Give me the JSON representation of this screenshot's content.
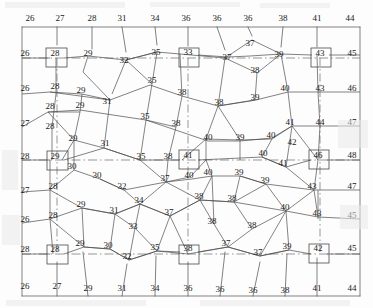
{
  "figure": {
    "kind": "survey-triangulation-network",
    "width": 373,
    "height": 308,
    "stroke_color": "#4a4a4a",
    "text_color": "#1a1a1a",
    "background": "#fdfdfd",
    "marker_shape": "square",
    "marker_count": 9,
    "baseline_style": "dash-dot"
  },
  "chart_data": {
    "type": "scatter",
    "title": "",
    "xlabel": "",
    "ylabel": "",
    "xlim": [
      0,
      373
    ],
    "ylim": [
      0,
      308
    ],
    "grid": false,
    "legend": null,
    "value_range": [
      26,
      48
    ],
    "nodes": [
      {
        "id": "n1",
        "label": "26",
        "x": 30,
        "y": 18,
        "boxed": false,
        "group": "border-top"
      },
      {
        "id": "n2",
        "label": "27",
        "x": 60,
        "y": 18,
        "boxed": false,
        "group": "border-top"
      },
      {
        "id": "n3",
        "label": "28",
        "x": 92,
        "y": 18,
        "boxed": false,
        "group": "border-top"
      },
      {
        "id": "n4",
        "label": "31",
        "x": 122,
        "y": 18,
        "boxed": false,
        "group": "border-top"
      },
      {
        "id": "n5",
        "label": "34",
        "x": 155,
        "y": 18,
        "boxed": false,
        "group": "border-top"
      },
      {
        "id": "n6",
        "label": "36",
        "x": 186,
        "y": 18,
        "boxed": false,
        "group": "border-top"
      },
      {
        "id": "n7",
        "label": "36",
        "x": 217,
        "y": 18,
        "boxed": false,
        "group": "border-top"
      },
      {
        "id": "n8",
        "label": "36",
        "x": 248,
        "y": 18,
        "boxed": false,
        "group": "border-top"
      },
      {
        "id": "n9",
        "label": "38",
        "x": 283,
        "y": 18,
        "boxed": false,
        "group": "border-top"
      },
      {
        "id": "n10",
        "label": "41",
        "x": 317,
        "y": 18,
        "boxed": false,
        "group": "border-top"
      },
      {
        "id": "n11",
        "label": "44",
        "x": 350,
        "y": 18,
        "boxed": false,
        "group": "border-top"
      },
      {
        "id": "m1",
        "label": "26",
        "x": 25,
        "y": 53,
        "boxed": false,
        "group": "row-b"
      },
      {
        "id": "m2",
        "label": "28",
        "x": 55,
        "y": 53,
        "boxed": true,
        "group": "row-b"
      },
      {
        "id": "m3",
        "label": "29",
        "x": 88,
        "y": 53,
        "boxed": false,
        "group": "row-b"
      },
      {
        "id": "m4",
        "label": "32",
        "x": 124,
        "y": 60,
        "boxed": false,
        "group": "row-b"
      },
      {
        "id": "m5",
        "label": "35",
        "x": 156,
        "y": 52,
        "boxed": false,
        "group": "row-b"
      },
      {
        "id": "m6",
        "label": "33",
        "x": 188,
        "y": 52,
        "boxed": true,
        "group": "row-b"
      },
      {
        "id": "m7",
        "label": "37",
        "x": 227,
        "y": 57,
        "boxed": false,
        "group": "row-b"
      },
      {
        "id": "m8",
        "label": "37",
        "x": 250,
        "y": 43,
        "boxed": false,
        "group": "row-b"
      },
      {
        "id": "m9",
        "label": "39",
        "x": 279,
        "y": 54,
        "boxed": false,
        "group": "row-b"
      },
      {
        "id": "m10",
        "label": "38",
        "x": 255,
        "y": 70,
        "boxed": false,
        "group": "row-b"
      },
      {
        "id": "m11",
        "label": "43",
        "x": 320,
        "y": 53,
        "boxed": true,
        "group": "row-b"
      },
      {
        "id": "m12",
        "label": "45",
        "x": 352,
        "y": 53,
        "boxed": false,
        "group": "row-b"
      },
      {
        "id": "p1",
        "label": "26",
        "x": 25,
        "y": 88,
        "boxed": false,
        "group": "row-c"
      },
      {
        "id": "p2",
        "label": "28",
        "x": 55,
        "y": 86,
        "boxed": false,
        "group": "row-c"
      },
      {
        "id": "p3",
        "label": "29",
        "x": 81,
        "y": 90,
        "boxed": false,
        "group": "row-c"
      },
      {
        "id": "p4",
        "label": "31",
        "x": 107,
        "y": 101,
        "boxed": false,
        "group": "row-c"
      },
      {
        "id": "p5",
        "label": "35",
        "x": 152,
        "y": 80,
        "boxed": false,
        "group": "row-c"
      },
      {
        "id": "p6",
        "label": "38",
        "x": 182,
        "y": 92,
        "boxed": false,
        "group": "row-c"
      },
      {
        "id": "p7",
        "label": "38",
        "x": 219,
        "y": 102,
        "boxed": false,
        "group": "row-c"
      },
      {
        "id": "p8",
        "label": "39",
        "x": 255,
        "y": 97,
        "boxed": false,
        "group": "row-c"
      },
      {
        "id": "p9",
        "label": "40",
        "x": 285,
        "y": 88,
        "boxed": false,
        "group": "row-c"
      },
      {
        "id": "p10",
        "label": "43",
        "x": 320,
        "y": 88,
        "boxed": false,
        "group": "row-c"
      },
      {
        "id": "p11",
        "label": "46",
        "x": 352,
        "y": 88,
        "boxed": false,
        "group": "row-c"
      },
      {
        "id": "q1",
        "label": "27",
        "x": 25,
        "y": 123,
        "boxed": false,
        "group": "row-d"
      },
      {
        "id": "q2",
        "label": "28",
        "x": 50,
        "y": 106,
        "boxed": false,
        "group": "row-d"
      },
      {
        "id": "q3",
        "label": "29",
        "x": 80,
        "y": 105,
        "boxed": false,
        "group": "row-d"
      },
      {
        "id": "q4",
        "label": "35",
        "x": 145,
        "y": 116,
        "boxed": false,
        "group": "row-d"
      },
      {
        "id": "q5",
        "label": "38",
        "x": 176,
        "y": 123,
        "boxed": false,
        "group": "row-d"
      },
      {
        "id": "q6",
        "label": "40",
        "x": 208,
        "y": 137,
        "boxed": false,
        "group": "row-d"
      },
      {
        "id": "q7",
        "label": "39",
        "x": 240,
        "y": 137,
        "boxed": false,
        "group": "row-d"
      },
      {
        "id": "q8",
        "label": "40",
        "x": 271,
        "y": 135,
        "boxed": false,
        "group": "row-d"
      },
      {
        "id": "q9",
        "label": "41",
        "x": 290,
        "y": 122,
        "boxed": false,
        "group": "row-d"
      },
      {
        "id": "q10",
        "label": "44",
        "x": 320,
        "y": 122,
        "boxed": false,
        "group": "row-d"
      },
      {
        "id": "q11",
        "label": "47",
        "x": 352,
        "y": 122,
        "boxed": false,
        "group": "row-d"
      },
      {
        "id": "q12",
        "label": "42",
        "x": 292,
        "y": 142,
        "boxed": false,
        "group": "row-d"
      },
      {
        "id": "r1",
        "label": "28",
        "x": 25,
        "y": 156,
        "boxed": false,
        "group": "row-e"
      },
      {
        "id": "r2",
        "label": "28",
        "x": 50,
        "y": 126,
        "boxed": false,
        "group": "row-e"
      },
      {
        "id": "r3",
        "label": "29",
        "x": 73,
        "y": 138,
        "boxed": false,
        "group": "row-e"
      },
      {
        "id": "r4",
        "label": "31",
        "x": 105,
        "y": 143,
        "boxed": false,
        "group": "row-e"
      },
      {
        "id": "r5",
        "label": "29",
        "x": 55,
        "y": 156,
        "boxed": true,
        "group": "row-e"
      },
      {
        "id": "r6",
        "label": "35",
        "x": 141,
        "y": 156,
        "boxed": false,
        "group": "row-e"
      },
      {
        "id": "r7",
        "label": "38",
        "x": 168,
        "y": 156,
        "boxed": false,
        "group": "row-e"
      },
      {
        "id": "r8",
        "label": "41",
        "x": 188,
        "y": 155,
        "boxed": true,
        "group": "row-e"
      },
      {
        "id": "r9",
        "label": "40",
        "x": 263,
        "y": 153,
        "boxed": false,
        "group": "row-e"
      },
      {
        "id": "r10",
        "label": "41",
        "x": 283,
        "y": 163,
        "boxed": false,
        "group": "row-e"
      },
      {
        "id": "r11",
        "label": "46",
        "x": 318,
        "y": 155,
        "boxed": true,
        "group": "row-e"
      },
      {
        "id": "r12",
        "label": "48",
        "x": 352,
        "y": 155,
        "boxed": false,
        "group": "row-e"
      },
      {
        "id": "s1",
        "label": "30",
        "x": 72,
        "y": 166,
        "boxed": false,
        "group": "row-f"
      },
      {
        "id": "s2",
        "label": "30",
        "x": 97,
        "y": 175,
        "boxed": false,
        "group": "row-f"
      },
      {
        "id": "s3",
        "label": "37",
        "x": 165,
        "y": 178,
        "boxed": false,
        "group": "row-f"
      },
      {
        "id": "s4",
        "label": "40",
        "x": 189,
        "y": 175,
        "boxed": false,
        "group": "row-f"
      },
      {
        "id": "s5",
        "label": "40",
        "x": 208,
        "y": 172,
        "boxed": false,
        "group": "row-f"
      },
      {
        "id": "s6",
        "label": "39",
        "x": 239,
        "y": 172,
        "boxed": false,
        "group": "row-f"
      },
      {
        "id": "s7",
        "label": "39",
        "x": 265,
        "y": 180,
        "boxed": false,
        "group": "row-f"
      },
      {
        "id": "s8",
        "label": "43",
        "x": 312,
        "y": 186,
        "boxed": false,
        "group": "row-f"
      },
      {
        "id": "s9",
        "label": "27",
        "x": 25,
        "y": 190,
        "boxed": false,
        "group": "row-f"
      },
      {
        "id": "s10",
        "label": "28",
        "x": 53,
        "y": 186,
        "boxed": false,
        "group": "row-f"
      },
      {
        "id": "s11",
        "label": "32",
        "x": 122,
        "y": 186,
        "boxed": false,
        "group": "row-f"
      },
      {
        "id": "s12",
        "label": "47",
        "x": 352,
        "y": 186,
        "boxed": false,
        "group": "row-f"
      },
      {
        "id": "t1",
        "label": "26",
        "x": 25,
        "y": 219,
        "boxed": false,
        "group": "row-g"
      },
      {
        "id": "t2",
        "label": "28",
        "x": 53,
        "y": 215,
        "boxed": false,
        "group": "row-g"
      },
      {
        "id": "t3",
        "label": "29",
        "x": 81,
        "y": 204,
        "boxed": false,
        "group": "row-g"
      },
      {
        "id": "t4",
        "label": "31",
        "x": 114,
        "y": 210,
        "boxed": false,
        "group": "row-g"
      },
      {
        "id": "t5",
        "label": "34",
        "x": 139,
        "y": 200,
        "boxed": false,
        "group": "row-g"
      },
      {
        "id": "t6",
        "label": "37",
        "x": 169,
        "y": 212,
        "boxed": false,
        "group": "row-g"
      },
      {
        "id": "t7",
        "label": "38",
        "x": 199,
        "y": 196,
        "boxed": false,
        "group": "row-g"
      },
      {
        "id": "t8",
        "label": "38",
        "x": 232,
        "y": 198,
        "boxed": false,
        "group": "row-g"
      },
      {
        "id": "t9",
        "label": "40",
        "x": 285,
        "y": 207,
        "boxed": false,
        "group": "row-g"
      },
      {
        "id": "t10",
        "label": "43",
        "x": 317,
        "y": 213,
        "boxed": false,
        "group": "row-g"
      },
      {
        "id": "t11",
        "label": "45",
        "x": 352,
        "y": 215,
        "boxed": false,
        "group": "row-g"
      },
      {
        "id": "t12",
        "label": "33",
        "x": 133,
        "y": 226,
        "boxed": false,
        "group": "row-g"
      },
      {
        "id": "t13",
        "label": "38",
        "x": 212,
        "y": 221,
        "boxed": false,
        "group": "row-g"
      },
      {
        "id": "t14",
        "label": "38",
        "x": 252,
        "y": 225,
        "boxed": false,
        "group": "row-g"
      },
      {
        "id": "u1",
        "label": "28",
        "x": 25,
        "y": 249,
        "boxed": false,
        "group": "row-h"
      },
      {
        "id": "u2",
        "label": "28",
        "x": 55,
        "y": 249,
        "boxed": true,
        "group": "row-h"
      },
      {
        "id": "u3",
        "label": "29",
        "x": 80,
        "y": 243,
        "boxed": false,
        "group": "row-h"
      },
      {
        "id": "u4",
        "label": "30",
        "x": 108,
        "y": 245,
        "boxed": false,
        "group": "row-h"
      },
      {
        "id": "u5",
        "label": "32",
        "x": 127,
        "y": 256,
        "boxed": false,
        "group": "row-h"
      },
      {
        "id": "u6",
        "label": "35",
        "x": 155,
        "y": 247,
        "boxed": false,
        "group": "row-h"
      },
      {
        "id": "u7",
        "label": "38",
        "x": 188,
        "y": 248,
        "boxed": true,
        "group": "row-h"
      },
      {
        "id": "u8",
        "label": "37",
        "x": 226,
        "y": 243,
        "boxed": false,
        "group": "row-h"
      },
      {
        "id": "u9",
        "label": "37",
        "x": 258,
        "y": 252,
        "boxed": false,
        "group": "row-h"
      },
      {
        "id": "u10",
        "label": "39",
        "x": 287,
        "y": 246,
        "boxed": false,
        "group": "row-h"
      },
      {
        "id": "u11",
        "label": "42",
        "x": 318,
        "y": 248,
        "boxed": true,
        "group": "row-h"
      },
      {
        "id": "u12",
        "label": "45",
        "x": 352,
        "y": 248,
        "boxed": false,
        "group": "row-h"
      },
      {
        "id": "v1",
        "label": "26",
        "x": 25,
        "y": 286,
        "boxed": false,
        "group": "border-bottom"
      },
      {
        "id": "v2",
        "label": "27",
        "x": 57,
        "y": 286,
        "boxed": false,
        "group": "border-bottom"
      },
      {
        "id": "v3",
        "label": "29",
        "x": 88,
        "y": 288,
        "boxed": false,
        "group": "border-bottom"
      },
      {
        "id": "v4",
        "label": "31",
        "x": 122,
        "y": 288,
        "boxed": false,
        "group": "border-bottom"
      },
      {
        "id": "v5",
        "label": "34",
        "x": 155,
        "y": 288,
        "boxed": false,
        "group": "border-bottom"
      },
      {
        "id": "v6",
        "label": "36",
        "x": 188,
        "y": 288,
        "boxed": false,
        "group": "border-bottom"
      },
      {
        "id": "v7",
        "label": "36",
        "x": 220,
        "y": 289,
        "boxed": false,
        "group": "border-bottom"
      },
      {
        "id": "v8",
        "label": "36",
        "x": 253,
        "y": 290,
        "boxed": false,
        "group": "border-bottom"
      },
      {
        "id": "v9",
        "label": "38",
        "x": 285,
        "y": 290,
        "boxed": false,
        "group": "border-bottom"
      },
      {
        "id": "v10",
        "label": "41",
        "x": 317,
        "y": 288,
        "boxed": false,
        "group": "border-bottom"
      },
      {
        "id": "v11",
        "label": "44",
        "x": 352,
        "y": 288,
        "boxed": false,
        "group": "border-bottom"
      }
    ],
    "marker_boxes": [
      {
        "x": 55,
        "y": 58,
        "label": "28"
      },
      {
        "x": 188,
        "y": 58,
        "label": "33"
      },
      {
        "x": 320,
        "y": 58,
        "label": "43"
      },
      {
        "x": 56,
        "y": 161,
        "label": "29"
      },
      {
        "x": 188,
        "y": 160,
        "label": "41"
      },
      {
        "x": 318,
        "y": 160,
        "label": "46"
      },
      {
        "x": 56,
        "y": 254,
        "label": "28"
      },
      {
        "x": 188,
        "y": 254,
        "label": "38"
      },
      {
        "x": 318,
        "y": 253,
        "label": "42"
      }
    ]
  }
}
